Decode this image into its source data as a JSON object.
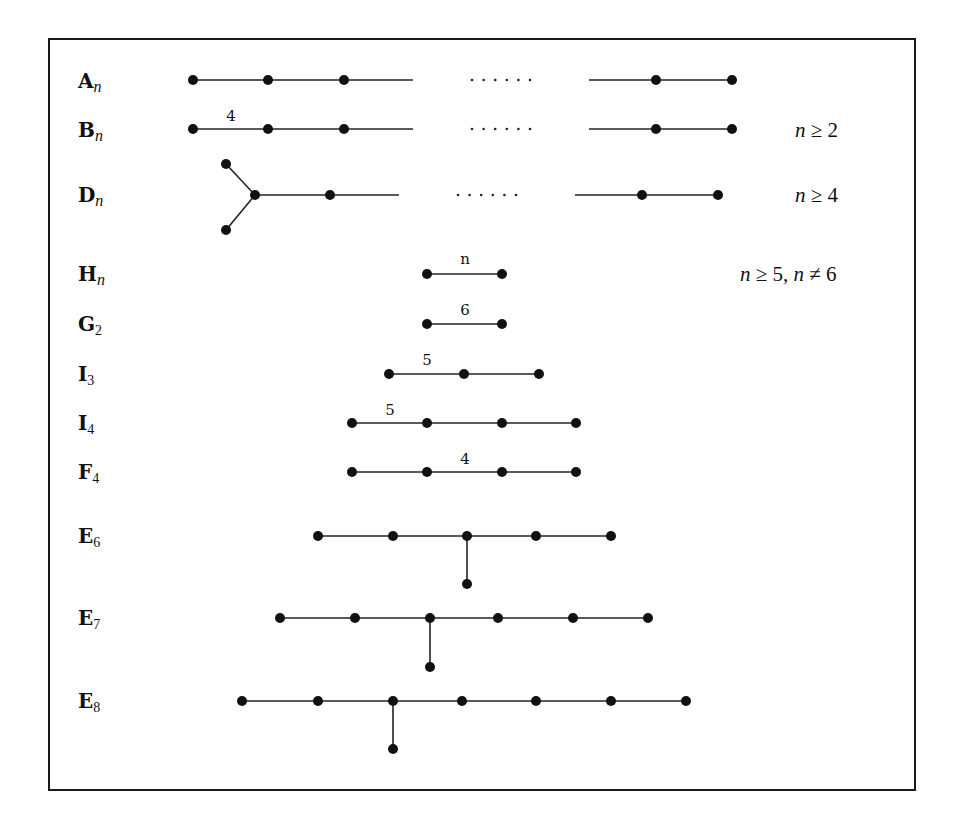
{
  "figure": {
    "node_radius": 5,
    "rows": [
      {
        "id": "A_n",
        "label_main": "A",
        "label_sub": "n",
        "sub_style": "italic",
        "label_y": 88,
        "nodes": [
          [
            193,
            80
          ],
          [
            268,
            80
          ],
          [
            344,
            80
          ],
          [
            656,
            80
          ],
          [
            732,
            80
          ]
        ],
        "edges": [
          [
            193,
            80,
            268,
            80
          ],
          [
            268,
            80,
            344,
            80
          ],
          [
            344,
            80,
            413,
            80
          ],
          [
            589,
            80,
            656,
            80
          ],
          [
            656,
            80,
            732,
            80
          ]
        ],
        "ellipsis": {
          "x_start": 472,
          "x_end": 530,
          "y": 80,
          "count": 6
        },
        "edge_labels": [],
        "condition": null
      },
      {
        "id": "B_n",
        "label_main": "B",
        "label_sub": "n",
        "sub_style": "italic",
        "label_y": 137,
        "nodes": [
          [
            193,
            129
          ],
          [
            268,
            129
          ],
          [
            344,
            129
          ],
          [
            656,
            129
          ],
          [
            732,
            129
          ]
        ],
        "edges": [
          [
            193,
            129,
            268,
            129
          ],
          [
            268,
            129,
            344,
            129
          ],
          [
            344,
            129,
            413,
            129
          ],
          [
            589,
            129,
            656,
            129
          ],
          [
            656,
            129,
            732,
            129
          ]
        ],
        "ellipsis": {
          "x_start": 472,
          "x_end": 530,
          "y": 129,
          "count": 6
        },
        "edge_labels": [
          {
            "text": "4",
            "x": 231,
            "y": 121
          }
        ],
        "condition": {
          "var": "n",
          "rel": "≥",
          "val": "2",
          "extra": null,
          "x": 795,
          "y": 137
        }
      },
      {
        "id": "D_n",
        "label_main": "D",
        "label_sub": "n",
        "sub_style": "italic",
        "label_y": 202,
        "nodes": [
          [
            226,
            164
          ],
          [
            226,
            230
          ],
          [
            255,
            195
          ],
          [
            330,
            195
          ],
          [
            642,
            195
          ],
          [
            718,
            195
          ]
        ],
        "edges": [
          [
            226,
            164,
            255,
            195
          ],
          [
            226,
            230,
            255,
            195
          ],
          [
            255,
            195,
            330,
            195
          ],
          [
            330,
            195,
            399,
            195
          ],
          [
            575,
            195,
            642,
            195
          ],
          [
            642,
            195,
            718,
            195
          ]
        ],
        "ellipsis": {
          "x_start": 458,
          "x_end": 516,
          "y": 195,
          "count": 6
        },
        "edge_labels": [],
        "condition": {
          "var": "n",
          "rel": "≥",
          "val": "4",
          "extra": null,
          "x": 795,
          "y": 202
        }
      },
      {
        "id": "H_n",
        "label_main": "H",
        "label_sub": "n",
        "sub_style": "italic",
        "label_y": 281,
        "nodes": [
          [
            427,
            274
          ],
          [
            502,
            274
          ]
        ],
        "edges": [
          [
            427,
            274,
            502,
            274
          ]
        ],
        "ellipsis": null,
        "edge_labels": [
          {
            "text": "n",
            "x": 465,
            "y": 264
          }
        ],
        "condition": {
          "var": "n",
          "rel": "≥",
          "val": "5,",
          "extra": {
            "var": "n",
            "rel": "≠",
            "val": "6"
          },
          "x": 740,
          "y": 281
        }
      },
      {
        "id": "G_2",
        "label_main": "G",
        "label_sub": "2",
        "sub_style": "num",
        "label_y": 331,
        "nodes": [
          [
            427,
            324
          ],
          [
            502,
            324
          ]
        ],
        "edges": [
          [
            427,
            324,
            502,
            324
          ]
        ],
        "ellipsis": null,
        "edge_labels": [
          {
            "text": "6",
            "x": 465,
            "y": 315
          }
        ],
        "condition": null
      },
      {
        "id": "I_3",
        "label_main": "I",
        "label_sub": "3",
        "sub_style": "num",
        "label_y": 381,
        "nodes": [
          [
            389,
            374
          ],
          [
            464,
            374
          ],
          [
            539,
            374
          ]
        ],
        "edges": [
          [
            389,
            374,
            464,
            374
          ],
          [
            464,
            374,
            539,
            374
          ]
        ],
        "ellipsis": null,
        "edge_labels": [
          {
            "text": "5",
            "x": 427,
            "y": 365
          }
        ],
        "condition": null
      },
      {
        "id": "I_4",
        "label_main": "I",
        "label_sub": "4",
        "sub_style": "num",
        "label_y": 430,
        "nodes": [
          [
            352,
            423
          ],
          [
            427,
            423
          ],
          [
            502,
            423
          ],
          [
            576,
            423
          ]
        ],
        "edges": [
          [
            352,
            423,
            427,
            423
          ],
          [
            427,
            423,
            502,
            423
          ],
          [
            502,
            423,
            576,
            423
          ]
        ],
        "ellipsis": null,
        "edge_labels": [
          {
            "text": "5",
            "x": 390,
            "y": 415
          }
        ],
        "condition": null
      },
      {
        "id": "F_4",
        "label_main": "F",
        "label_sub": "4",
        "sub_style": "num",
        "label_y": 479,
        "nodes": [
          [
            352,
            472
          ],
          [
            427,
            472
          ],
          [
            502,
            472
          ],
          [
            576,
            472
          ]
        ],
        "edges": [
          [
            352,
            472,
            427,
            472
          ],
          [
            427,
            472,
            502,
            472
          ],
          [
            502,
            472,
            576,
            472
          ]
        ],
        "ellipsis": null,
        "edge_labels": [
          {
            "text": "4",
            "x": 465,
            "y": 464
          }
        ],
        "condition": null
      },
      {
        "id": "E_6",
        "label_main": "E",
        "label_sub": "6",
        "sub_style": "num",
        "label_y": 543,
        "nodes": [
          [
            318,
            536
          ],
          [
            393,
            536
          ],
          [
            467,
            536
          ],
          [
            536,
            536
          ],
          [
            611,
            536
          ],
          [
            467,
            584
          ]
        ],
        "edges": [
          [
            318,
            536,
            393,
            536
          ],
          [
            393,
            536,
            467,
            536
          ],
          [
            467,
            536,
            536,
            536
          ],
          [
            536,
            536,
            611,
            536
          ],
          [
            467,
            536,
            467,
            584
          ]
        ],
        "ellipsis": null,
        "edge_labels": [],
        "condition": null
      },
      {
        "id": "E_7",
        "label_main": "E",
        "label_sub": "7",
        "sub_style": "num",
        "label_y": 625,
        "nodes": [
          [
            280,
            618
          ],
          [
            355,
            618
          ],
          [
            430,
            618
          ],
          [
            498,
            618
          ],
          [
            573,
            618
          ],
          [
            648,
            618
          ],
          [
            430,
            667
          ]
        ],
        "edges": [
          [
            280,
            618,
            355,
            618
          ],
          [
            355,
            618,
            430,
            618
          ],
          [
            430,
            618,
            498,
            618
          ],
          [
            498,
            618,
            573,
            618
          ],
          [
            573,
            618,
            648,
            618
          ],
          [
            430,
            618,
            430,
            667
          ]
        ],
        "ellipsis": null,
        "edge_labels": [],
        "condition": null
      },
      {
        "id": "E_8",
        "label_main": "E",
        "label_sub": "8",
        "sub_style": "num",
        "label_y": 708,
        "nodes": [
          [
            242,
            701
          ],
          [
            318,
            701
          ],
          [
            393,
            701
          ],
          [
            462,
            701
          ],
          [
            536,
            701
          ],
          [
            611,
            701
          ],
          [
            686,
            701
          ],
          [
            393,
            749
          ]
        ],
        "edges": [
          [
            242,
            701,
            318,
            701
          ],
          [
            318,
            701,
            393,
            701
          ],
          [
            393,
            701,
            462,
            701
          ],
          [
            462,
            701,
            536,
            701
          ],
          [
            536,
            701,
            611,
            701
          ],
          [
            611,
            701,
            686,
            701
          ],
          [
            393,
            701,
            393,
            749
          ]
        ],
        "ellipsis": null,
        "edge_labels": [],
        "condition": null
      }
    ]
  }
}
